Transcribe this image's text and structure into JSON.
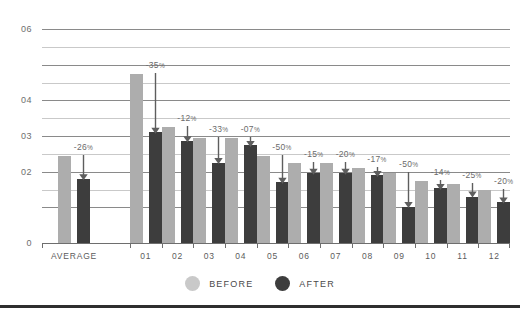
{
  "chart_data": {
    "type": "bar",
    "title": "",
    "subtitle": "",
    "xlabel": "",
    "ylabel": "",
    "ylim": [
      0,
      0.6
    ],
    "grid": true,
    "legend_position": "bottom-center",
    "categories": [
      "AVERAGE",
      "01",
      "02",
      "03",
      "04",
      "05",
      "06",
      "07",
      "08",
      "09",
      "10",
      "11",
      "12"
    ],
    "y_ticks": [
      {
        "value": 0.6,
        "label": "06",
        "major": true
      },
      {
        "value": 0.55,
        "label": "",
        "major": false
      },
      {
        "value": 0.5,
        "label": "",
        "major": true
      },
      {
        "value": 0.45,
        "label": "",
        "major": false
      },
      {
        "value": 0.4,
        "label": "04",
        "major": true
      },
      {
        "value": 0.35,
        "label": "",
        "major": false
      },
      {
        "value": 0.3,
        "label": "03",
        "major": true
      },
      {
        "value": 0.25,
        "label": "",
        "major": false
      },
      {
        "value": 0.2,
        "label": "02",
        "major": true
      },
      {
        "value": 0.15,
        "label": "",
        "major": false
      },
      {
        "value": 0.1,
        "label": "",
        "major": true
      },
      {
        "value": 0.0,
        "label": "0",
        "major": false
      }
    ],
    "series": [
      {
        "name": "BEFORE",
        "color": "#adadad",
        "values": [
          0.245,
          0.475,
          0.325,
          0.295,
          0.295,
          0.245,
          0.225,
          0.225,
          0.21,
          0.195,
          0.175,
          0.165,
          0.15
        ]
      },
      {
        "name": "AFTER",
        "color": "#3d3d3d",
        "values": [
          0.18,
          0.31,
          0.285,
          0.225,
          0.275,
          0.17,
          0.195,
          0.195,
          0.19,
          0.1,
          0.155,
          0.13,
          0.115
        ]
      }
    ],
    "delta_labels": [
      "-26%",
      "-35%",
      "-12%",
      "-33%",
      "-07%",
      "-50%",
      "-15%",
      "-20%",
      "-17%",
      "-50%",
      "-14%",
      "-25%",
      "-20%"
    ],
    "annotations": {
      "arrow_note": "downward arrow from BEFORE bar top to AFTER bar top for each category"
    }
  },
  "legend": {
    "items": [
      {
        "label": "BEFORE",
        "swatch": "before"
      },
      {
        "label": "AFTER",
        "swatch": "after"
      }
    ]
  }
}
